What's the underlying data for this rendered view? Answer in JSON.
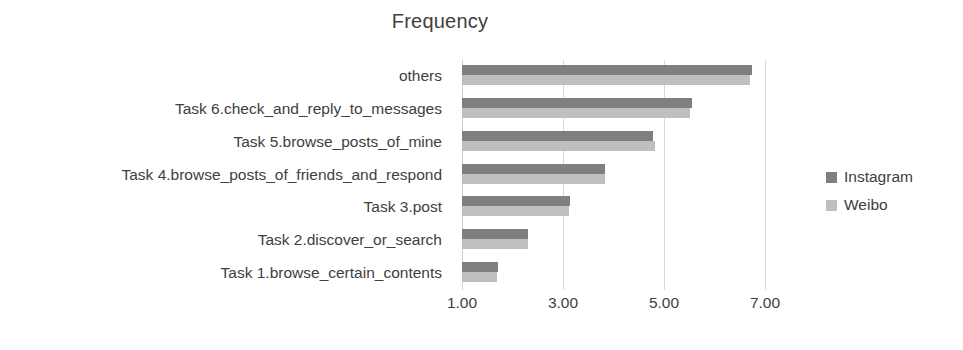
{
  "chart_data": {
    "type": "bar",
    "orientation": "horizontal",
    "title": "Frequency",
    "xlabel": "",
    "ylabel": "",
    "categories": [
      "Task 1.browse_certain_contents",
      "Task 2.discover_or_search",
      "Task 3.post",
      "Task 4.browse_posts_of_friends_and_respond",
      "Task 5.browse_posts_of_mine",
      "Task 6.check_and_reply_to_messages",
      "others"
    ],
    "series": [
      {
        "name": "Instagram",
        "color": "#7f7f7f",
        "values": [
          1.72,
          2.31,
          3.14,
          3.83,
          4.79,
          5.55,
          6.74
        ]
      },
      {
        "name": "Weibo",
        "color": "#bfbfbf",
        "values": [
          1.7,
          2.3,
          3.12,
          3.83,
          4.82,
          5.51,
          6.7
        ]
      }
    ],
    "xlim": [
      1.0,
      7.4
    ],
    "xticks": [
      1.0,
      3.0,
      5.0,
      7.0
    ],
    "xtick_labels": [
      "1.00",
      "3.00",
      "5.00",
      "7.00"
    ],
    "grid": "vertical",
    "legend_position": "right",
    "legend": [
      {
        "label": "Instagram",
        "swatch": "#7f7f7f"
      },
      {
        "label": "Weibo",
        "swatch": "#bfbfbf"
      }
    ]
  }
}
